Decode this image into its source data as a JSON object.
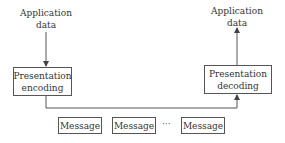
{
  "sender": {
    "input_label_line1": "Application",
    "input_label_line2": "data",
    "box_line1": "Presentation",
    "box_line2": "encoding"
  },
  "receiver": {
    "output_label_line1": "Application",
    "output_label_line2": "data",
    "box_line1": "Presentation",
    "box_line2": "decoding"
  },
  "messages": [
    {
      "label": "Message"
    },
    {
      "label": "Message"
    },
    {
      "label": "Message"
    }
  ],
  "ellipsis": "···",
  "colors": {
    "line": "#555555",
    "text": "#333333",
    "background": "#ffffff"
  }
}
